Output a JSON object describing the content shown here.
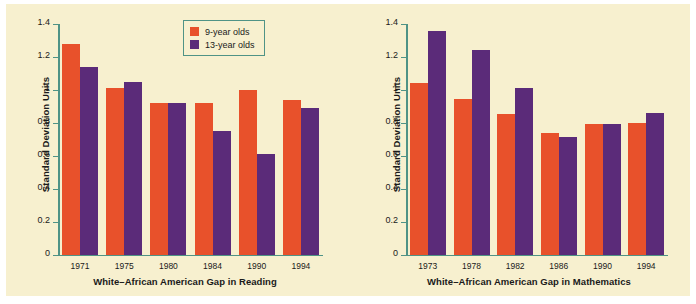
{
  "figure": {
    "background_color": "#f7f0cf",
    "axis_color": "#4f9386",
    "text_color": "#1a1a1a"
  },
  "legend": {
    "position": "top-center-left-panel",
    "border_color": "#4f9386",
    "entries": [
      {
        "label": "9-year olds",
        "color": "#e8512b"
      },
      {
        "label": "13-year olds",
        "color": "#5b2b79"
      }
    ]
  },
  "chart_data": [
    {
      "type": "bar",
      "title": "",
      "xlabel": "White–African American Gap in Reading",
      "ylabel": "Standard Deviation Units",
      "categories": [
        "1971",
        "1975",
        "1980",
        "1984",
        "1990",
        "1994"
      ],
      "series": [
        {
          "name": "9-year olds",
          "color": "#e8512b",
          "values": [
            1.28,
            1.01,
            0.92,
            0.92,
            1.0,
            0.94
          ]
        },
        {
          "name": "13-year olds",
          "color": "#5b2b79",
          "values": [
            1.14,
            1.05,
            0.92,
            0.75,
            0.61,
            0.89
          ]
        }
      ],
      "ylim": [
        0,
        1.4
      ],
      "yticks": [
        "0",
        "0.2",
        "0.4",
        "0.6",
        "0.8",
        "1",
        "1.2",
        "1.4"
      ],
      "ytickvalues": [
        0,
        0.2,
        0.4,
        0.6,
        0.8,
        1.0,
        1.2,
        1.4
      ],
      "grid": false,
      "legend_position": "upper right"
    },
    {
      "type": "bar",
      "title": "",
      "xlabel": "White–African American Gap in Mathematics",
      "ylabel": "Standard Deviation Units",
      "categories": [
        "1973",
        "1978",
        "1982",
        "1986",
        "1990",
        "1994"
      ],
      "series": [
        {
          "name": "9-year olds",
          "color": "#e8512b",
          "values": [
            1.04,
            0.945,
            0.855,
            0.74,
            0.795,
            0.8
          ]
        },
        {
          "name": "13-year olds",
          "color": "#5b2b79",
          "values": [
            1.355,
            1.245,
            1.01,
            0.715,
            0.795,
            0.86
          ]
        }
      ],
      "ylim": [
        0,
        1.4
      ],
      "yticks": [
        "0",
        "0.2",
        "0.4",
        "0.6",
        "0.8",
        "1",
        "1.2",
        "1.4"
      ],
      "ytickvalues": [
        0,
        0.2,
        0.4,
        0.6,
        0.8,
        1.0,
        1.2,
        1.4
      ],
      "grid": false,
      "legend_position": "none"
    }
  ]
}
